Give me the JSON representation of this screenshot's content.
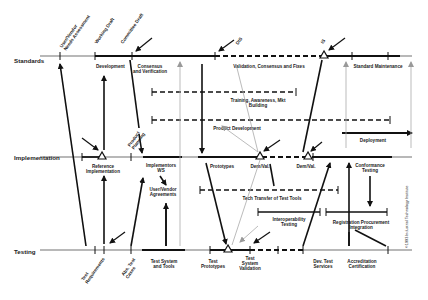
{
  "rows": {
    "standards": "Standards",
    "implementation": "Implementation",
    "testing": "Testing"
  },
  "milestones_top": {
    "user_vendor": [
      "User/Vendor",
      "Needs Assessment"
    ],
    "working_draft": "Working Draft",
    "committee_draft": "Committee Draft",
    "dis": "DIS",
    "is": "IS"
  },
  "standards_labels": {
    "development": "Development",
    "consensus": [
      "Consensus",
      "and Verification"
    ],
    "validation": "Validation, Consensus and Fixes",
    "maintenance": "Standard Maintenance",
    "training": [
      "Training, Awareness, Mkt",
      "Building"
    ],
    "product_dev": "Product Development",
    "deployment": "Deployment"
  },
  "implementation_labels": {
    "product_planning": [
      "Product",
      "Planning"
    ],
    "reference_impl": [
      "Reference",
      "Implementation"
    ],
    "implementors_ws": [
      "Implementors",
      "WS"
    ],
    "user_vendor_agreements": [
      "User/Vendor",
      "Agreements"
    ],
    "prototypes": "Prototypes",
    "demval1": "Dem/Val.",
    "demval2": "Dem/Val.",
    "conformance": [
      "Conformance",
      "Testing"
    ],
    "tech_transfer": "Tech Transfer of Test Tools",
    "interoperability": [
      "Interoperability",
      "Testing"
    ],
    "registration": [
      "Registration Procurement",
      "Integration"
    ]
  },
  "testing_labels": {
    "test_requirements": [
      "Test",
      "Requirements"
    ],
    "abs_test_cases": [
      "Abs. Test",
      "Cases"
    ],
    "test_system_tools": [
      "Test System",
      "and Tools"
    ],
    "test_prototypes": [
      "Test",
      "Prototypes"
    ],
    "test_system_validation": [
      "Test",
      "System",
      "Validation"
    ],
    "dev_test_services": [
      "Dev. Test",
      "Services"
    ],
    "accreditation": [
      "Accreditation",
      "Certification"
    ]
  },
  "copyright": "©1993 Industrial Technology Institute"
}
